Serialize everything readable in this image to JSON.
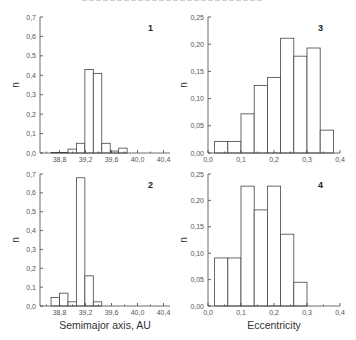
{
  "chart_data": [
    {
      "type": "bar",
      "panel_label": "1",
      "title": "",
      "xlabel": "",
      "ylabel": "n",
      "xlim": [
        38.5,
        40.5
      ],
      "ylim": [
        0,
        0.7
      ],
      "xticks": [
        "38,8",
        "39,2",
        "39,6",
        "40,0",
        "40,4"
      ],
      "yticks": [
        "0,0",
        "0,1",
        "0,2",
        "0,3",
        "0,4",
        "0,5",
        "0,6",
        "0,7"
      ],
      "bin_edges": [
        38.67,
        38.8,
        38.93,
        39.06,
        39.19,
        39.32,
        39.45,
        39.58,
        39.71,
        39.84,
        39.97,
        40.1,
        40.23
      ],
      "bins": [
        {
          "x0": 38.67,
          "x1": 38.93,
          "value": 0.003
        },
        {
          "x0": 38.93,
          "x1": 39.06,
          "value": 0.02
        },
        {
          "x0": 39.06,
          "x1": 39.19,
          "value": 0.05
        },
        {
          "x0": 39.19,
          "x1": 39.32,
          "value": 0.43
        },
        {
          "x0": 39.32,
          "x1": 39.45,
          "value": 0.41
        },
        {
          "x0": 39.45,
          "x1": 39.58,
          "value": 0.05
        },
        {
          "x0": 39.58,
          "x1": 39.71,
          "value": 0.01
        },
        {
          "x0": 39.71,
          "x1": 39.84,
          "value": 0.025
        }
      ],
      "grid": false
    },
    {
      "type": "bar",
      "panel_label": "2",
      "title": "",
      "xlabel": "Semimajor axis, AU",
      "ylabel": "n",
      "xlim": [
        38.5,
        40.5
      ],
      "ylim": [
        0,
        0.7
      ],
      "xticks": [
        "38,8",
        "39,2",
        "39,6",
        "40,0",
        "40,4"
      ],
      "yticks": [
        "0,0",
        "0,1",
        "0,2",
        "0,3",
        "0,4",
        "0,5",
        "0,6",
        "0,7"
      ],
      "bins": [
        {
          "value": 0.045
        },
        {
          "value": 0.068
        },
        {
          "value": 0.022
        },
        {
          "value": 0.68
        },
        {
          "value": 0.16
        },
        {
          "value": 0.022
        },
        {
          "value": 0.0
        },
        {
          "value": 0.0
        }
      ],
      "grid": false
    },
    {
      "type": "bar",
      "panel_label": "3",
      "title": "",
      "xlabel": "",
      "ylabel": "n",
      "xlim": [
        0.0,
        0.4
      ],
      "ylim": [
        0,
        0.25
      ],
      "xticks": [
        "0,0",
        "0,1",
        "0,2",
        "0,3",
        "0,4"
      ],
      "yticks": [
        "0,00",
        "0,05",
        "0,10",
        "0,15",
        "0,20",
        "0,25"
      ],
      "bins": [
        {
          "x0": 0.02,
          "x1": 0.06,
          "value": 0.021
        },
        {
          "x0": 0.06,
          "x1": 0.1,
          "value": 0.021
        },
        {
          "x0": 0.1,
          "x1": 0.14,
          "value": 0.072
        },
        {
          "x0": 0.14,
          "x1": 0.18,
          "value": 0.124
        },
        {
          "x0": 0.18,
          "x1": 0.22,
          "value": 0.139
        },
        {
          "x0": 0.22,
          "x1": 0.26,
          "value": 0.211
        },
        {
          "x0": 0.26,
          "x1": 0.3,
          "value": 0.178
        },
        {
          "x0": 0.3,
          "x1": 0.34,
          "value": 0.193
        },
        {
          "x0": 0.34,
          "x1": 0.38,
          "value": 0.042
        }
      ],
      "grid": false
    },
    {
      "type": "bar",
      "panel_label": "4",
      "title": "",
      "xlabel": "Eccentricity",
      "ylabel": "n",
      "xlim": [
        0.0,
        0.4
      ],
      "ylim": [
        0,
        0.25
      ],
      "xticks": [
        "0,0",
        "0,1",
        "0,2",
        "0,3",
        "0,4"
      ],
      "yticks": [
        "0,00",
        "0,05",
        "0,10",
        "0,15",
        "0,20",
        "0,25"
      ],
      "bins": [
        {
          "x0": 0.02,
          "x1": 0.06,
          "value": 0.091
        },
        {
          "x0": 0.06,
          "x1": 0.1,
          "value": 0.091
        },
        {
          "x0": 0.1,
          "x1": 0.14,
          "value": 0.227
        },
        {
          "x0": 0.14,
          "x1": 0.18,
          "value": 0.182
        },
        {
          "x0": 0.18,
          "x1": 0.22,
          "value": 0.227
        },
        {
          "x0": 0.22,
          "x1": 0.26,
          "value": 0.136
        },
        {
          "x0": 0.26,
          "x1": 0.3,
          "value": 0.045
        }
      ],
      "grid": false
    }
  ]
}
